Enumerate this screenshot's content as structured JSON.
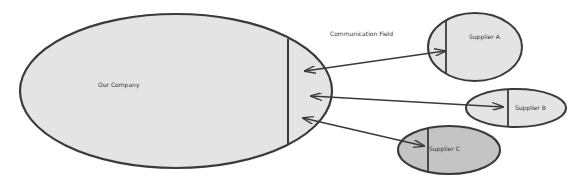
{
  "diagram": {
    "colors": {
      "stroke": "#3a3a3a",
      "fill_light": "#e4e4e4",
      "fill_dark": "#c4c4c4",
      "background": "#ffffff"
    },
    "annotation": "Communication Field",
    "nodes": [
      {
        "id": "our-company",
        "label": "Our Company"
      },
      {
        "id": "supplier-a",
        "label": "Supplier A"
      },
      {
        "id": "supplier-b",
        "label": "Supplier B"
      },
      {
        "id": "supplier-c",
        "label": "Supplier C"
      }
    ],
    "edges": [
      {
        "from": "our-company",
        "to": "supplier-a",
        "type": "bidirectional"
      },
      {
        "from": "our-company",
        "to": "supplier-b",
        "type": "bidirectional"
      },
      {
        "from": "our-company",
        "to": "supplier-c",
        "type": "bidirectional"
      }
    ]
  }
}
